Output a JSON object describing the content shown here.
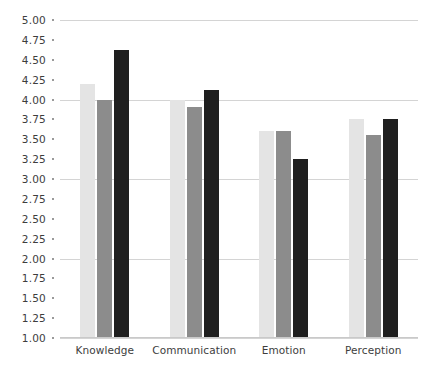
{
  "chart_data": {
    "type": "bar",
    "title": "",
    "subtitle": "",
    "xlabel": "",
    "ylabel": "",
    "categories": [
      "Knowledge",
      "Communication",
      "Emotion",
      "Perception"
    ],
    "series": [
      {
        "name": "Series 1",
        "color": "#e4e4e4",
        "values": [
          4.2,
          4.0,
          3.6,
          3.75
        ]
      },
      {
        "name": "Series 2",
        "color": "#8c8c8c",
        "values": [
          4.0,
          3.9,
          3.6,
          3.55
        ]
      },
      {
        "name": "Series 3",
        "color": "#1f1f1f",
        "values": [
          4.62,
          4.12,
          3.25,
          3.75
        ]
      }
    ],
    "ylim": [
      1.0,
      5.0
    ],
    "ytick_step": 0.25,
    "ytick_labels": [
      "5.00",
      "4.75",
      "4.50",
      "4.25",
      "4.00",
      "3.75",
      "3.50",
      "3.25",
      "3.00",
      "2.75",
      "2.50",
      "2.25",
      "2.00",
      "1.75",
      "1.50",
      "1.25",
      "1.00"
    ],
    "gridline_values": [
      5.0,
      4.0,
      3.0,
      2.0,
      1.0
    ],
    "grid": true,
    "legend": "none",
    "legend_position": "none",
    "annotations": [],
    "colors": {
      "gridline": "#d4d4d4",
      "axis_text": "#3d3d3d",
      "background": "#ffffff",
      "tick_dot": "#9a9a9a"
    }
  }
}
